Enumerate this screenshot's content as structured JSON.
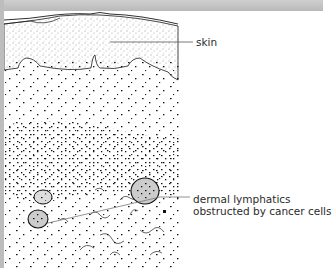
{
  "figure": {
    "labels": [
      {
        "id": "skin",
        "text": "skin"
      },
      {
        "id": "lymphatics",
        "line1": "dermal lymphatics",
        "line2": "obstructed by cancer cells"
      }
    ]
  },
  "colors": {
    "border": "#bdbdbd",
    "ink": "#1a1a1a",
    "leader": "#555555",
    "background": "#ffffff"
  }
}
